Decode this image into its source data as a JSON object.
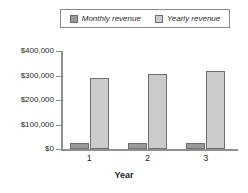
{
  "chart_data": {
    "type": "bar",
    "title": "",
    "xlabel": "Year",
    "ylabel": "",
    "categories": [
      "1",
      "2",
      "3"
    ],
    "series": [
      {
        "name": "Monthly revenue",
        "values": [
          24000,
          25000,
          26000
        ],
        "color": "#9a9a9a"
      },
      {
        "name": "Yearly revenue",
        "values": [
          290000,
          305000,
          320000
        ],
        "color": "#cbcbcb"
      }
    ],
    "ylim": [
      0,
      400000
    ],
    "ytick_values": [
      400000,
      300000,
      200000,
      100000,
      0
    ],
    "ytick_labels": [
      "$400,000",
      "$300,000",
      "$200,000",
      "$100,000",
      "$0"
    ],
    "xtick_labels": [
      "1",
      "2",
      "3"
    ],
    "grid": false,
    "legend_position": "top-center"
  },
  "legend": {
    "entries": [
      {
        "label": "Monthly revenue",
        "swatch": "#9a9a9a"
      },
      {
        "label": "Yearly revenue",
        "swatch": "#cbcbcb"
      }
    ]
  },
  "axes": {
    "x_title": "Year",
    "y_ticks": [
      "$400,000",
      "$300,000",
      "$200,000",
      "$100,000",
      "$0"
    ],
    "x_ticks": [
      "1",
      "2",
      "3"
    ]
  },
  "colors": {
    "monthly": "#9a9a9a",
    "yearly": "#cbcbcb",
    "axis": "#8f8f8f",
    "text": "#1f1f1f",
    "background": "#ffffff"
  }
}
